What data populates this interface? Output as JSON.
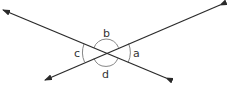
{
  "diagram": {
    "line_color": "#2a2a2a",
    "arc_color": "#777777",
    "intersection": [
      106,
      53
    ],
    "lines": [
      {
        "id": "line-1",
        "from": [
          2,
          10
        ],
        "to": [
          166,
          78
        ]
      },
      {
        "id": "line-2",
        "from": [
          45,
          80
        ],
        "to": [
          220,
          5
        ]
      }
    ],
    "angles": [
      {
        "label": "a",
        "position": "right"
      },
      {
        "label": "b",
        "position": "top"
      },
      {
        "label": "c",
        "position": "left"
      },
      {
        "label": "d",
        "position": "bottom"
      }
    ]
  }
}
